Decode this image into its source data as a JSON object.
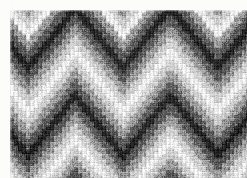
{
  "image": {
    "title": "Bargello flame-stitch needlepoint textile",
    "subject": "hand-stitched canvas work fabric, close-up",
    "rendering": "grayscale photograph",
    "width_px": 247,
    "height_px": 178,
    "background_color": "#fcfcfb",
    "margin": {
      "top_px": 10,
      "left_px": 10,
      "right_px": 0,
      "bottom_px": 0
    }
  },
  "fabric": {
    "area": {
      "x_px": 10,
      "y_px": 10,
      "width_px": 237,
      "height_px": 168
    },
    "technique": "bargello / flame stitch",
    "motif": "chevron zigzag waves with nested tonal bands",
    "stitch_column_width_px": 4,
    "stitch_step_height_px": 6,
    "wave": {
      "period_px": 95,
      "repeats_across": 2.5,
      "amplitude_px": 30,
      "peak_x_positions_px": [
        18,
        113,
        208
      ],
      "valley_x_positions_px": [
        66,
        161,
        256
      ]
    },
    "band_sequence_top_to_bottom": [
      "mid-grey",
      "dark",
      "near-black",
      "dark",
      "mid-grey",
      "light",
      "near-white",
      "light",
      "mid-grey",
      "dark",
      "near-black",
      "dark",
      "mid-grey",
      "light",
      "near-white",
      "light",
      "mid-grey",
      "dark",
      "near-black",
      "mid-grey",
      "light",
      "near-white",
      "light",
      "mid-grey",
      "dark",
      "near-black",
      "dark",
      "mid-grey",
      "light",
      "near-white"
    ],
    "band_height_px": 11,
    "tones": {
      "near-white": "#eeeeec",
      "light": "#cfcfcc",
      "mid-grey": "#9a9a97",
      "dark": "#5b5b59",
      "near-black": "#242423"
    },
    "tone_levels": [
      238,
      207,
      154,
      91,
      36
    ],
    "texture": {
      "vertical_stitch_lines": true,
      "horizontal_row_lines": true,
      "grain_noise": true,
      "blur_px": 0.35
    }
  }
}
